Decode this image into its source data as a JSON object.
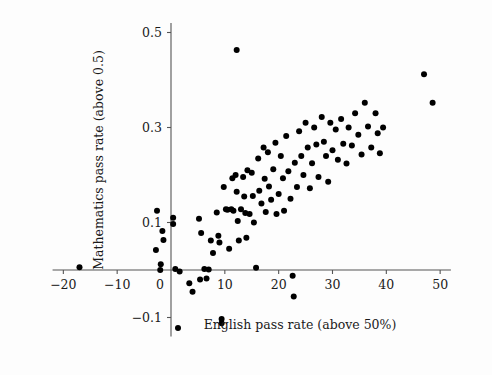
{
  "chart_data": {
    "type": "scatter",
    "title": "",
    "xlabel": "English pass rate (above 50%)",
    "ylabel": "Mathematics pass rate (above 0.5)",
    "xlim": [
      -22,
      52
    ],
    "ylim": [
      -0.14,
      0.52
    ],
    "xticks": [
      -20,
      -10,
      0,
      10,
      20,
      30,
      40,
      50
    ],
    "xticklabels": [
      "−20",
      "−10",
      "0",
      "10",
      "20",
      "30",
      "40",
      "50"
    ],
    "yticks": [
      -0.1,
      0.1,
      0.3,
      0.5
    ],
    "yticklabels": [
      "−0.1",
      "0.1",
      "0.3",
      "0.5"
    ],
    "grid": false,
    "legend": null,
    "marker": "filled-circle",
    "marker_color": "#000000",
    "marker_size": 6,
    "axis_style": "crossed-spines-at-origin",
    "n_points": 107,
    "points": [
      [
        -17.0,
        0.006
      ],
      [
        -2.6,
        0.125
      ],
      [
        -2.8,
        0.042
      ],
      [
        -1.9,
        0.012
      ],
      [
        -1.6,
        0.082
      ],
      [
        -1.4,
        0.063
      ],
      [
        -2.0,
        0.0
      ],
      [
        0.4,
        0.11
      ],
      [
        0.4,
        0.097
      ],
      [
        0.8,
        0.002
      ],
      [
        1.6,
        -0.003
      ],
      [
        1.3,
        -0.122
      ],
      [
        3.4,
        -0.028
      ],
      [
        4.0,
        -0.046
      ],
      [
        5.4,
        -0.02
      ],
      [
        5.2,
        0.108
      ],
      [
        5.6,
        0.078
      ],
      [
        6.2,
        0.002
      ],
      [
        6.6,
        -0.018
      ],
      [
        7.0,
        0.001
      ],
      [
        7.4,
        0.062
      ],
      [
        7.8,
        0.036
      ],
      [
        8.5,
        0.121
      ],
      [
        8.8,
        0.072
      ],
      [
        9.0,
        0.058
      ],
      [
        9.4,
        -0.103
      ],
      [
        9.4,
        -0.112
      ],
      [
        9.8,
        0.175
      ],
      [
        10.2,
        0.128
      ],
      [
        10.5,
        0.127
      ],
      [
        10.8,
        0.045
      ],
      [
        11.2,
        0.128
      ],
      [
        11.6,
        0.125
      ],
      [
        11.4,
        0.193
      ],
      [
        12.0,
        0.2
      ],
      [
        12.2,
        0.165
      ],
      [
        12.4,
        0.103
      ],
      [
        12.6,
        0.062
      ],
      [
        12.2,
        0.463
      ],
      [
        13.0,
        0.128
      ],
      [
        13.4,
        0.196
      ],
      [
        13.6,
        0.155
      ],
      [
        13.8,
        0.12
      ],
      [
        14.2,
        0.21
      ],
      [
        14.0,
        0.068
      ],
      [
        14.6,
        0.118
      ],
      [
        15.0,
        0.205
      ],
      [
        15.2,
        0.156
      ],
      [
        15.4,
        0.1
      ],
      [
        15.8,
        0.005
      ],
      [
        16.2,
        0.235
      ],
      [
        16.4,
        0.167
      ],
      [
        16.8,
        0.14
      ],
      [
        17.2,
        0.258
      ],
      [
        17.4,
        0.192
      ],
      [
        17.6,
        0.122
      ],
      [
        18.0,
        0.248
      ],
      [
        18.2,
        0.176
      ],
      [
        18.6,
        0.148
      ],
      [
        19.0,
        0.212
      ],
      [
        19.4,
        0.268
      ],
      [
        19.6,
        0.118
      ],
      [
        20.0,
        0.16
      ],
      [
        20.4,
        0.24
      ],
      [
        20.8,
        0.193
      ],
      [
        21.0,
        0.125
      ],
      [
        21.4,
        0.282
      ],
      [
        21.8,
        0.208
      ],
      [
        22.2,
        0.15
      ],
      [
        22.6,
        -0.012
      ],
      [
        22.8,
        -0.056
      ],
      [
        23.0,
        0.226
      ],
      [
        23.4,
        0.175
      ],
      [
        23.8,
        0.292
      ],
      [
        24.2,
        0.24
      ],
      [
        24.6,
        0.2
      ],
      [
        25.0,
        0.31
      ],
      [
        25.4,
        0.258
      ],
      [
        25.8,
        0.172
      ],
      [
        26.2,
        0.225
      ],
      [
        26.6,
        0.3
      ],
      [
        27.0,
        0.264
      ],
      [
        27.4,
        0.196
      ],
      [
        28.0,
        0.322
      ],
      [
        28.4,
        0.27
      ],
      [
        28.8,
        0.24
      ],
      [
        29.2,
        0.186
      ],
      [
        29.6,
        0.31
      ],
      [
        30.0,
        0.252
      ],
      [
        30.6,
        0.296
      ],
      [
        31.0,
        0.232
      ],
      [
        31.6,
        0.318
      ],
      [
        32.0,
        0.266
      ],
      [
        32.6,
        0.224
      ],
      [
        33.0,
        0.3
      ],
      [
        33.6,
        0.262
      ],
      [
        34.2,
        0.33
      ],
      [
        34.8,
        0.285
      ],
      [
        35.4,
        0.243
      ],
      [
        36.0,
        0.352
      ],
      [
        36.6,
        0.302
      ],
      [
        37.2,
        0.258
      ],
      [
        38.0,
        0.33
      ],
      [
        38.4,
        0.288
      ],
      [
        38.8,
        0.246
      ],
      [
        39.4,
        0.3
      ],
      [
        47.0,
        0.412
      ],
      [
        48.6,
        0.352
      ]
    ]
  }
}
